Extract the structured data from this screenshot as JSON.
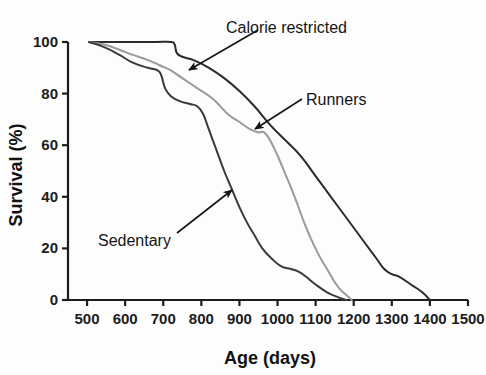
{
  "figure": {
    "background_color": "#fdfdfd",
    "axis_color": "#1c1c1c"
  },
  "chart_data": {
    "type": "line",
    "title": "",
    "subtitle": "",
    "xlabel": "Age (days)",
    "ylabel": "Survival (%)",
    "xlim": [
      450,
      1500
    ],
    "ylim": [
      0,
      100
    ],
    "grid": false,
    "legend_position": "annotations-with-arrows",
    "xticks": [
      500,
      600,
      700,
      800,
      900,
      1000,
      1100,
      1200,
      1300,
      1400,
      1500
    ],
    "xtick_labels": [
      "500",
      "600",
      "700",
      "800",
      "900",
      "1000",
      "1100",
      "1200",
      "1300",
      "1400",
      "1500"
    ],
    "yticks": [
      0,
      20,
      40,
      60,
      80,
      100
    ],
    "ytick_labels": [
      "0",
      "20",
      "40",
      "60",
      "80",
      "100"
    ],
    "series": [
      {
        "name": "Calorie restricted",
        "color": "#2b2b2b",
        "width": 2.0,
        "x": [
          505,
          560,
          620,
          680,
          720,
          730,
          740,
          780,
          820,
          860,
          900,
          940,
          980,
          1020,
          1060,
          1100,
          1140,
          1170,
          1200,
          1230,
          1260,
          1280,
          1300,
          1320,
          1350,
          1380,
          1400
        ],
        "y": [
          100,
          100,
          100,
          100,
          100,
          99,
          95,
          93,
          90,
          86,
          81,
          75,
          68,
          62,
          56,
          48,
          40,
          34,
          28,
          22,
          16,
          12,
          10,
          9,
          6,
          3,
          0
        ]
      },
      {
        "name": "Runners",
        "color": "#9a9a9a",
        "width": 2.0,
        "x": [
          505,
          545,
          585,
          620,
          660,
          690,
          720,
          750,
          790,
          830,
          870,
          900,
          930,
          950,
          965,
          980,
          1000,
          1020,
          1045,
          1070,
          1090,
          1110,
          1130,
          1150,
          1165,
          1180,
          1195
        ],
        "y": [
          100,
          99,
          97,
          95,
          93,
          91,
          89,
          86,
          82,
          78,
          72,
          69,
          66,
          65,
          65,
          62,
          56,
          49,
          40,
          30,
          23,
          17,
          12,
          7,
          4,
          2,
          0
        ]
      },
      {
        "name": "Sedentary",
        "color": "#3a3a3a",
        "width": 2.0,
        "x": [
          505,
          545,
          585,
          620,
          660,
          685,
          695,
          705,
          720,
          745,
          770,
          790,
          805,
          820,
          840,
          860,
          880,
          900,
          920,
          940,
          960,
          985,
          1010,
          1035,
          1055,
          1075,
          1100,
          1130,
          1160,
          1180
        ],
        "y": [
          100,
          98,
          95,
          92,
          90,
          89,
          87,
          82,
          79,
          77,
          76,
          75,
          72,
          66,
          58,
          50,
          43,
          36,
          30,
          25,
          20,
          16,
          13,
          12,
          11,
          9,
          6,
          3,
          1,
          0
        ]
      }
    ],
    "annotations": [
      {
        "text": "Calorie restricted",
        "label_x": 226,
        "label_y": 22,
        "arrow_from_x": 258,
        "arrow_from_y": 30,
        "arrow_to_x": 189,
        "arrow_to_y": 70
      },
      {
        "text": "Runners",
        "label_x": 306,
        "label_y": 94,
        "arrow_from_x": 302,
        "arrow_from_y": 99,
        "arrow_to_x": 255,
        "arrow_to_y": 129
      },
      {
        "text": "Sedentary",
        "label_x": 98,
        "label_y": 235,
        "arrow_from_x": 177,
        "arrow_from_y": 233,
        "arrow_to_x": 232,
        "arrow_to_y": 190
      }
    ]
  }
}
